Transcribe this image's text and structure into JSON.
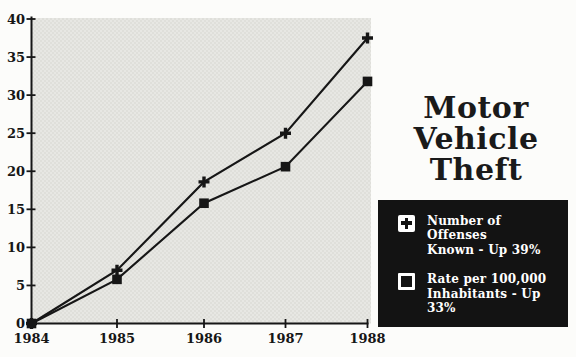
{
  "chart_data": {
    "type": "line",
    "title": "Motor Vehicle Theft",
    "subtitle": "",
    "xlabel": "",
    "ylabel": "",
    "x_tick_labels": [
      "1984",
      "1985",
      "1986",
      "1987",
      "1988"
    ],
    "y_ticks": [
      0,
      5,
      10,
      15,
      20,
      25,
      30,
      35,
      40
    ],
    "ylim": [
      0,
      40
    ],
    "grid": false,
    "legend_position": "right-box",
    "plot_background": "stippled light gray",
    "series": [
      {
        "name": "Number of Offenses Known - Up 39%",
        "marker": "plus",
        "color": "#161616",
        "values": [
          0,
          7,
          18.6,
          25,
          37.5
        ]
      },
      {
        "name": "Rate per 100,000 Inhabitants - Up 33%",
        "marker": "filled-square",
        "color": "#161616",
        "values": [
          0,
          5.8,
          15.8,
          20.6,
          31.8
        ]
      }
    ]
  },
  "title": {
    "lines": [
      "Motor",
      "Vehicle",
      "Theft"
    ]
  },
  "legend": {
    "items": [
      {
        "icon": "plus-marker",
        "line1": "Number of Offenses",
        "line2": "Known - Up 39%"
      },
      {
        "icon": "square-marker",
        "line1": "Rate per 100,000",
        "line2": "Inhabitants - Up 33%"
      }
    ]
  },
  "colors": {
    "ink": "#161616",
    "axis": "#161616",
    "plot_bg_base": "#e7e7e3",
    "plot_bg_dot": "#d1d1ca",
    "legend_bg": "#131313",
    "legend_text": "#ffffff",
    "page_bg": "#fcfcfa"
  }
}
